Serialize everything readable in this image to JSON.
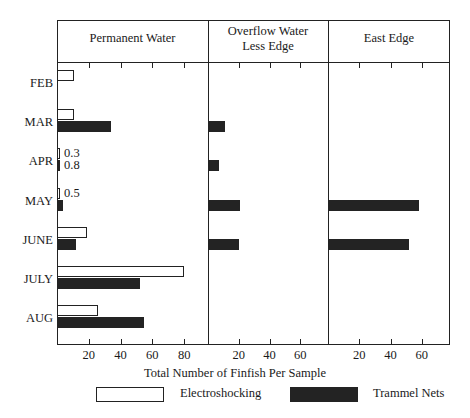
{
  "chart_data": {
    "type": "bar",
    "title": "",
    "xlabel": "Total Number of Finfish Per Sample",
    "ylabel": "",
    "orientation": "horizontal",
    "grid": false,
    "legend_position": "bottom",
    "categories": [
      "FEB",
      "MAR",
      "APR",
      "MAY",
      "JUNE",
      "JULY",
      "AUG"
    ],
    "panels": [
      {
        "name": "Permanent Water",
        "title_lines": [
          "Permanent Water"
        ],
        "xlim": [
          0,
          95
        ],
        "xticks": [
          20,
          40,
          60,
          80
        ],
        "xticklabels": [
          "20",
          "40",
          "60",
          "80"
        ],
        "series": [
          {
            "name": "Electroshocking",
            "color": "#ffffff",
            "values": [
              11,
              11,
              0.3,
              0.5,
              19,
              80,
              26
            ],
            "labels": [
              "",
              "",
              "0.3",
              "0.5",
              "",
              "",
              ""
            ]
          },
          {
            "name": "Trammel Nets",
            "color": "#232323",
            "values": [
              0,
              34,
              0.8,
              4,
              12,
              52,
              55
            ],
            "labels": [
              "",
              "",
              "0.8",
              "",
              "",
              "",
              ""
            ]
          }
        ]
      },
      {
        "name": "Overflow Water Less Edge",
        "title_lines": [
          "Overflow Water",
          "Less Edge"
        ],
        "xlim": [
          0,
          78
        ],
        "xticks": [
          20,
          40,
          60
        ],
        "xticklabels": [
          "20",
          "40",
          "60"
        ],
        "series": [
          {
            "name": "Electroshocking",
            "color": "#ffffff",
            "values": [
              0,
              0,
              0,
              0,
              0,
              0,
              0
            ],
            "labels": [
              "",
              "",
              "",
              "",
              "",
              "",
              ""
            ]
          },
          {
            "name": "Trammel Nets",
            "color": "#232323",
            "values": [
              0,
              11,
              7,
              21,
              20,
              0,
              0
            ],
            "labels": [
              "",
              "",
              "",
              "",
              "",
              "",
              ""
            ]
          }
        ]
      },
      {
        "name": "East Edge",
        "title_lines": [
          "East Edge"
        ],
        "xlim": [
          0,
          78
        ],
        "xticks": [
          20,
          40,
          60
        ],
        "xticklabels": [
          "20",
          "40",
          "60"
        ],
        "series": [
          {
            "name": "Electroshocking",
            "color": "#ffffff",
            "values": [
              0,
              0,
              0,
              0,
              0,
              0,
              0
            ],
            "labels": [
              "",
              "",
              "",
              "",
              "",
              "",
              ""
            ]
          },
          {
            "name": "Trammel Nets",
            "color": "#232323",
            "values": [
              0,
              0,
              0,
              58,
              52,
              0,
              0
            ],
            "labels": [
              "",
              "",
              "",
              "",
              "",
              "",
              ""
            ]
          }
        ]
      }
    ],
    "legend": [
      {
        "label": "Electroshocking",
        "color": "#ffffff",
        "style": "outline"
      },
      {
        "label": "Trammel Nets",
        "color": "#232323",
        "style": "filled"
      }
    ]
  }
}
